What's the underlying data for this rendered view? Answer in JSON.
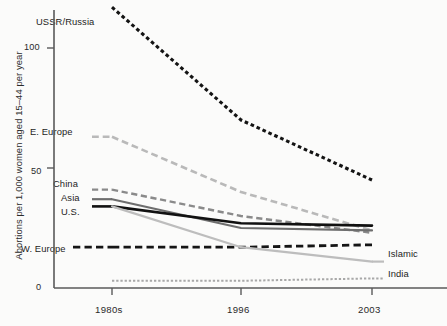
{
  "chart_data": {
    "type": "line",
    "title": "",
    "subtitle": "",
    "xlabel": "",
    "ylabel": "Abortions per 1,000 women aged 15–44 per year",
    "categories": [
      "1980s",
      "1996",
      "2003"
    ],
    "x_tick_labels": [
      "1980s",
      "1996",
      "2003"
    ],
    "y_tick_labels": [
      "0",
      "50",
      "100"
    ],
    "y_ticks": [
      0,
      50,
      100
    ],
    "ylim": [
      0,
      120
    ],
    "grid": false,
    "legend_position": "inline-labels",
    "series": [
      {
        "name": "USSR/Russia",
        "values": [
          117,
          70,
          45
        ],
        "color": "#141414",
        "style": "dotted",
        "width": 3.1,
        "label_side": "left",
        "label_x": 36,
        "label_y": 22
      },
      {
        "name": "E. Europe",
        "values": [
          63,
          40,
          24
        ],
        "color": "#b9b9b9",
        "style": "dashed",
        "width": 2.6,
        "label_side": "left",
        "label_x": 30,
        "label_y": 132
      },
      {
        "name": "China",
        "values": [
          41,
          30,
          23
        ],
        "color": "#8a8a8a",
        "style": "dashed",
        "width": 2.4,
        "label_side": "left",
        "label_x": 54,
        "label_y": 182
      },
      {
        "name": "Asia",
        "values": [
          37,
          25,
          24
        ],
        "color": "#6e6e6e",
        "style": "solid",
        "width": 2.2,
        "label_side": "left",
        "label_x": 62,
        "label_y": 196
      },
      {
        "name": "U.S.",
        "values": [
          34,
          27,
          26
        ],
        "color": "#111111",
        "style": "solid",
        "width": 2.6,
        "label_side": "left",
        "label_x": 62,
        "label_y": 209
      },
      {
        "name": "W. Europe",
        "values": [
          17,
          17,
          18
        ],
        "color": "#151515",
        "style": "dashed",
        "width": 2.8,
        "label_side": "left",
        "label_x": 22,
        "label_y": 247
      },
      {
        "name": "Islamic",
        "values": [
          34,
          17,
          11
        ],
        "color": "#bdbdbd",
        "style": "solid",
        "width": 2.2,
        "label_side": "right",
        "label_x": 386,
        "label_y": 251
      },
      {
        "name": "India",
        "values": [
          3,
          3,
          4
        ],
        "color": "#a8a8a8",
        "style": "dotted",
        "width": 2.0,
        "label_side": "right",
        "label_x": 386,
        "label_y": 272
      }
    ],
    "axis_color": "#5a5a5a",
    "background": "#fbfbfa"
  },
  "axis": {
    "y_title": "Abortions per 1,000 women aged 15–44 per year",
    "y_tick_0": "0",
    "y_tick_50": "50",
    "y_tick_100": "100",
    "x_tick_1": "1980s",
    "x_tick_2": "1996",
    "x_tick_3": "2003"
  },
  "labels": {
    "ussr_russia": "USSR/Russia",
    "e_europe": "E. Europe",
    "china": "China",
    "asia": "Asia",
    "us": "U.S.",
    "w_europe": "W. Europe",
    "islamic": "Islamic",
    "india": "India"
  }
}
